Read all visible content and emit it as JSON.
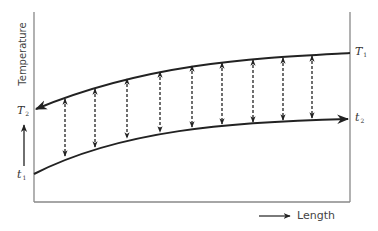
{
  "diagram": {
    "y_axis_label": "Temperature",
    "x_axis_label": "Length",
    "labels": {
      "T1": {
        "base": "T",
        "sub": "1"
      },
      "T2": {
        "base": "T",
        "sub": "2"
      },
      "t1": {
        "base": "t",
        "sub": "1"
      },
      "t2": {
        "base": "t",
        "sub": "2"
      }
    },
    "curves": {
      "hot_fluid": {
        "description": "Upper curve, flowing right-to-left, from T1 to T2",
        "direction": "right-to-left"
      },
      "cold_fluid": {
        "description": "Lower curve, flowing left-to-right, from t1 to t2",
        "direction": "left-to-right"
      }
    },
    "heat_transfer_arrows": {
      "count": 9,
      "style": "dashed double-headed vertical"
    },
    "colors": {
      "line": "#222222",
      "axis": "#888888",
      "text": "#444444"
    }
  }
}
